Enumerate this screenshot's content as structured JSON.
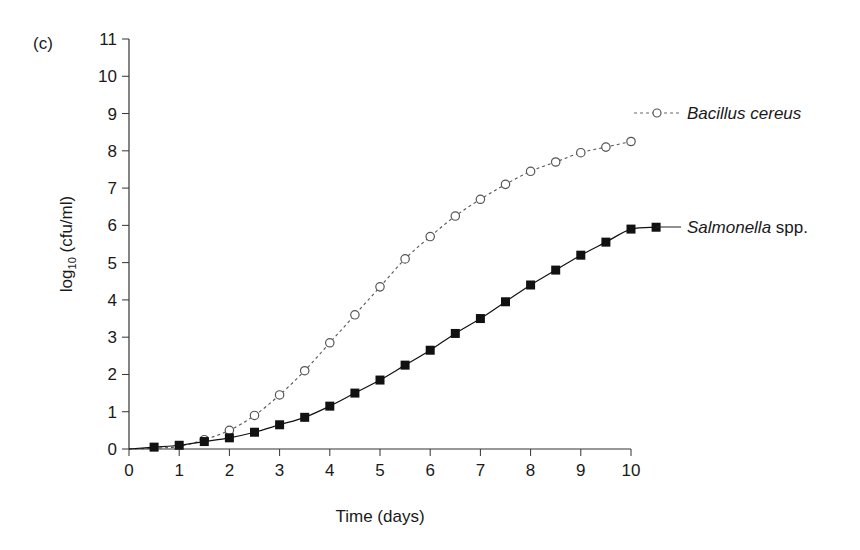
{
  "panel_label": "(c)",
  "chart_data": {
    "type": "line",
    "title": "",
    "xlabel": "Time (days)",
    "ylabel": "log10 (cfu/ml)",
    "ylabel_parts": {
      "base": "log",
      "sub": "10",
      "rest": " (cfu/ml)"
    },
    "xlim": [
      0,
      10
    ],
    "ylim": [
      0,
      11
    ],
    "x_ticks": [
      0,
      1,
      2,
      3,
      4,
      5,
      6,
      7,
      8,
      9,
      10
    ],
    "y_ticks": [
      0,
      1,
      2,
      3,
      4,
      5,
      6,
      7,
      8,
      9,
      10,
      11
    ],
    "grid": false,
    "legend_position": "inline-right",
    "series": [
      {
        "name": "Bacillus cereus",
        "label_italic": "Bacillus cereus",
        "label_roman": "",
        "marker": "open-circle",
        "line_style": "dotted",
        "color": "#555555",
        "x": [
          0,
          0.5,
          1,
          1.5,
          2,
          2.5,
          3,
          3.5,
          4,
          4.5,
          5,
          5.5,
          6,
          6.5,
          7,
          7.5,
          8,
          8.5,
          9,
          9.5,
          10
        ],
        "values": [
          0,
          0.02,
          0.07,
          0.25,
          0.5,
          0.9,
          1.45,
          2.1,
          2.85,
          3.6,
          4.35,
          5.1,
          5.7,
          6.25,
          6.7,
          7.1,
          7.45,
          7.7,
          7.95,
          8.1,
          8.25
        ],
        "marker_x": [
          1.5,
          2,
          2.5,
          3,
          3.5,
          4,
          4.5,
          5,
          5.5,
          6,
          6.5,
          7,
          7.5,
          8,
          8.5,
          9,
          9.5,
          10
        ]
      },
      {
        "name": "Salmonella spp.",
        "label_italic": "Salmonella",
        "label_roman": " spp.",
        "marker": "filled-square",
        "line_style": "solid",
        "color": "#111111",
        "x": [
          0,
          0.5,
          1,
          1.5,
          2,
          2.5,
          3,
          3.5,
          4,
          4.5,
          5,
          5.5,
          6,
          6.5,
          7,
          7.5,
          8,
          8.5,
          9,
          9.5,
          10,
          10.5
        ],
        "values": [
          0,
          0.05,
          0.1,
          0.2,
          0.3,
          0.45,
          0.65,
          0.85,
          1.15,
          1.5,
          1.85,
          2.25,
          2.65,
          3.1,
          3.5,
          3.95,
          4.4,
          4.8,
          5.2,
          5.55,
          5.9,
          5.95
        ],
        "marker_x": [
          0.5,
          1,
          1.5,
          2,
          2.5,
          3,
          3.5,
          4,
          4.5,
          5,
          5.5,
          6,
          6.5,
          7,
          7.5,
          8,
          8.5,
          9,
          9.5,
          10,
          10.5
        ]
      }
    ]
  }
}
